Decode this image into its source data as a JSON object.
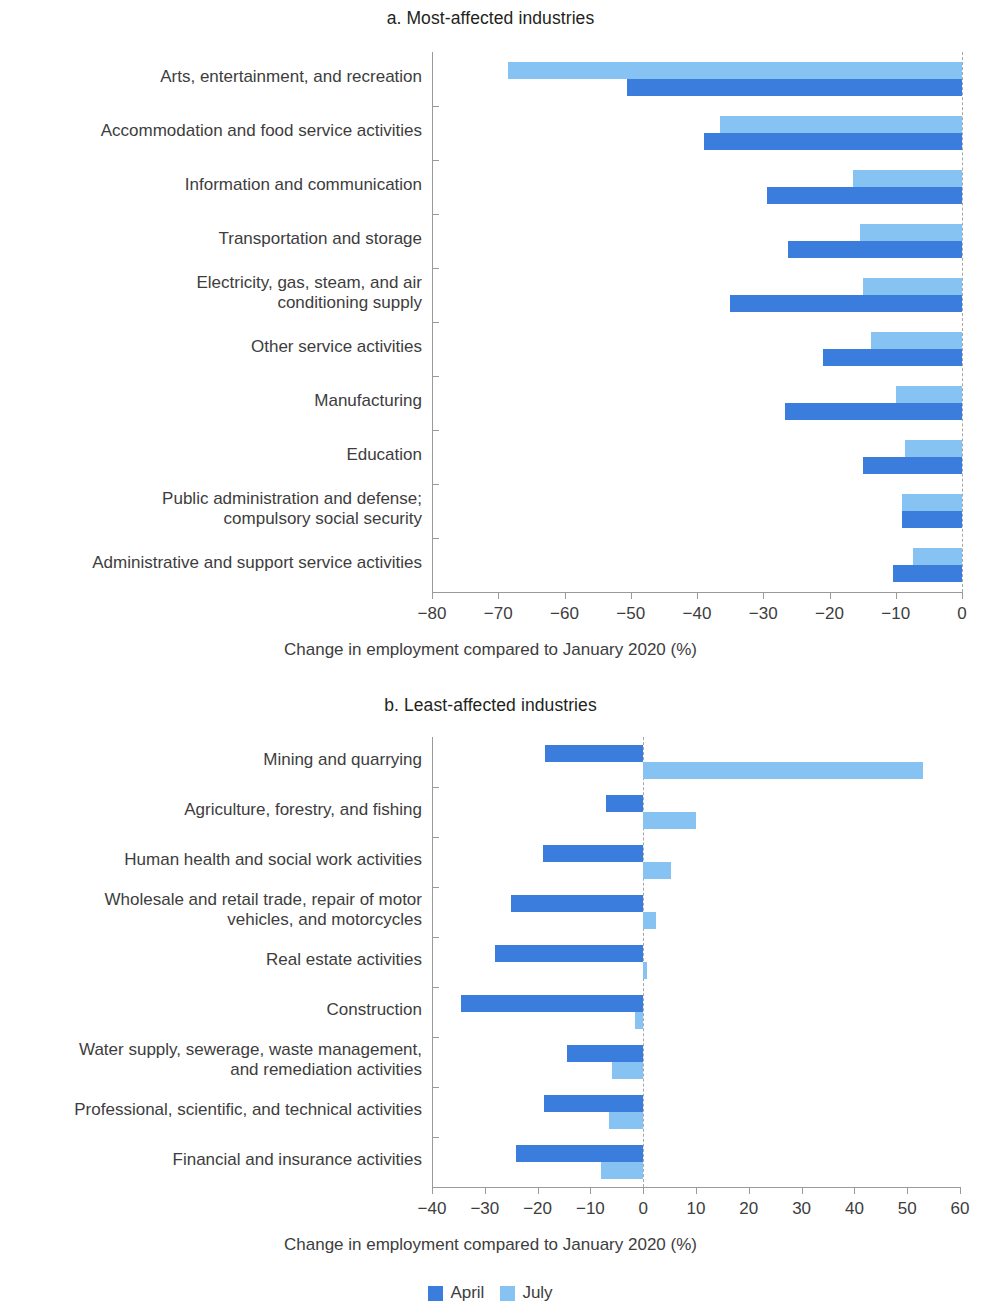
{
  "legend": {
    "items": [
      {
        "label": "April",
        "color": "#3b7ddd"
      },
      {
        "label": "July",
        "color": "#87c3f2"
      }
    ]
  },
  "panel_a": {
    "title": "a. Most-affected industries",
    "xlabel": "Change in employment compared to January 2020 (%)"
  },
  "panel_b": {
    "title": "b. Least-affected industries",
    "xlabel": "Change in employment compared to January 2020 (%)"
  },
  "chart_data": [
    {
      "type": "bar",
      "orientation": "horizontal",
      "title": "a. Most-affected industries",
      "xlabel": "Change in employment compared to January 2020 (%)",
      "ylabel": "",
      "xlim": [
        -80,
        0
      ],
      "xticks": [
        -80,
        -70,
        -60,
        -50,
        -40,
        -30,
        -20,
        -10,
        0
      ],
      "xticklabels": [
        "−80",
        "−70",
        "−60",
        "−50",
        "−40",
        "−30",
        "−20",
        "−10",
        "0"
      ],
      "grid": false,
      "legend_position": "bottom-center",
      "categories": [
        "Arts, entertainment, and recreation",
        "Accommodation and food service activities",
        "Information and communication",
        "Transportation and storage",
        "Electricity, gas, steam, and air\nconditioning supply",
        "Other service activities",
        "Manufacturing",
        "Education",
        "Public administration and defense;\ncompulsory social security",
        "Administrative and support service activities"
      ],
      "series": [
        {
          "name": "April",
          "color": "#3b7ddd",
          "values": [
            -50.5,
            -39.0,
            -29.4,
            -26.2,
            -35.0,
            -21.0,
            -26.7,
            -15.0,
            -9.0,
            -10.4
          ]
        },
        {
          "name": "July",
          "color": "#87c3f2",
          "values": [
            -68.5,
            -36.5,
            -16.4,
            -15.4,
            -15.0,
            -13.7,
            -10.0,
            -8.6,
            -9.0,
            -7.4
          ]
        }
      ]
    },
    {
      "type": "bar",
      "orientation": "horizontal",
      "title": "b. Least-affected industries",
      "xlabel": "Change in employment compared to January 2020 (%)",
      "ylabel": "",
      "xlim": [
        -40,
        60
      ],
      "xticks": [
        -40,
        -30,
        -20,
        -10,
        0,
        10,
        20,
        30,
        40,
        50,
        60
      ],
      "xticklabels": [
        "−40",
        "−30",
        "−20",
        "−10",
        "0",
        "10",
        "20",
        "30",
        "40",
        "50",
        "60"
      ],
      "grid": false,
      "legend_position": "bottom-center",
      "categories": [
        "Mining and quarrying",
        "Agriculture, forestry, and fishing",
        "Human health and social work activities",
        "Wholesale and retail trade, repair of motor\nvehicles, and motorcycles",
        "Real estate activities",
        "Construction",
        "Water supply, sewerage, waste management,\nand remediation activities",
        "Professional, scientific, and technical activities",
        "Financial and insurance activities"
      ],
      "series": [
        {
          "name": "April",
          "color": "#3b7ddd",
          "values": [
            -18.6,
            -7.0,
            -19.0,
            -25.0,
            -28.0,
            -34.5,
            -14.5,
            -18.8,
            -24.0
          ]
        },
        {
          "name": "July",
          "color": "#87c3f2",
          "values": [
            53.0,
            10.0,
            5.2,
            2.4,
            0.8,
            -1.6,
            -6.0,
            -6.5,
            -8.0
          ]
        }
      ]
    }
  ]
}
